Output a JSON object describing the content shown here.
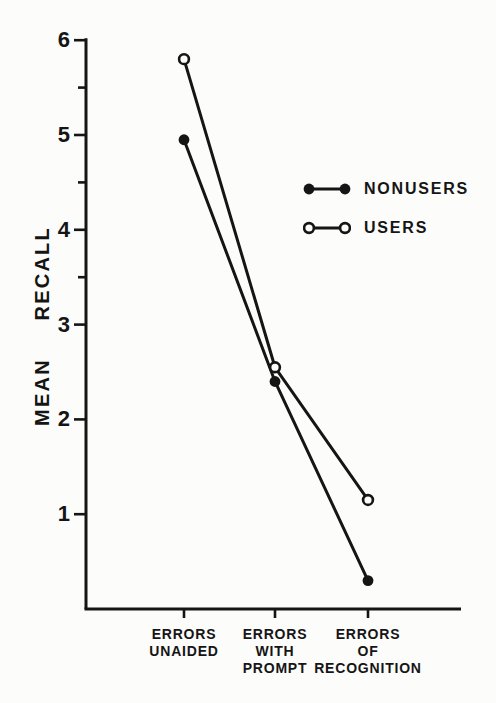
{
  "figure": {
    "ink_color": "#151515",
    "paper_color": "#fcfcfa"
  },
  "chart_data": {
    "type": "line",
    "title": "",
    "xlabel": "",
    "ylabel": "MEAN RECALL",
    "categories": [
      "ERRORS UNAIDED",
      "ERRORS WITH PROMPT",
      "ERRORS OF RECOGNITION"
    ],
    "category_label_lines": [
      [
        "ERRORS",
        "UNAIDED"
      ],
      [
        "ERRORS",
        "WITH",
        "PROMPT"
      ],
      [
        "ERRORS",
        "OF",
        "RECOGNITION"
      ]
    ],
    "series": [
      {
        "name": "NONUSERS",
        "marker": "filled-circle",
        "values": [
          4.95,
          2.4,
          0.3
        ]
      },
      {
        "name": "USERS",
        "marker": "open-circle",
        "values": [
          5.8,
          2.55,
          1.15
        ]
      }
    ],
    "ylim": [
      0,
      6
    ],
    "yticks": [
      1,
      2,
      3,
      4,
      5,
      6
    ],
    "y_minor_ticks": [
      3.5,
      4.5,
      5.5
    ],
    "grid": false,
    "legend_position": "upper-right"
  }
}
